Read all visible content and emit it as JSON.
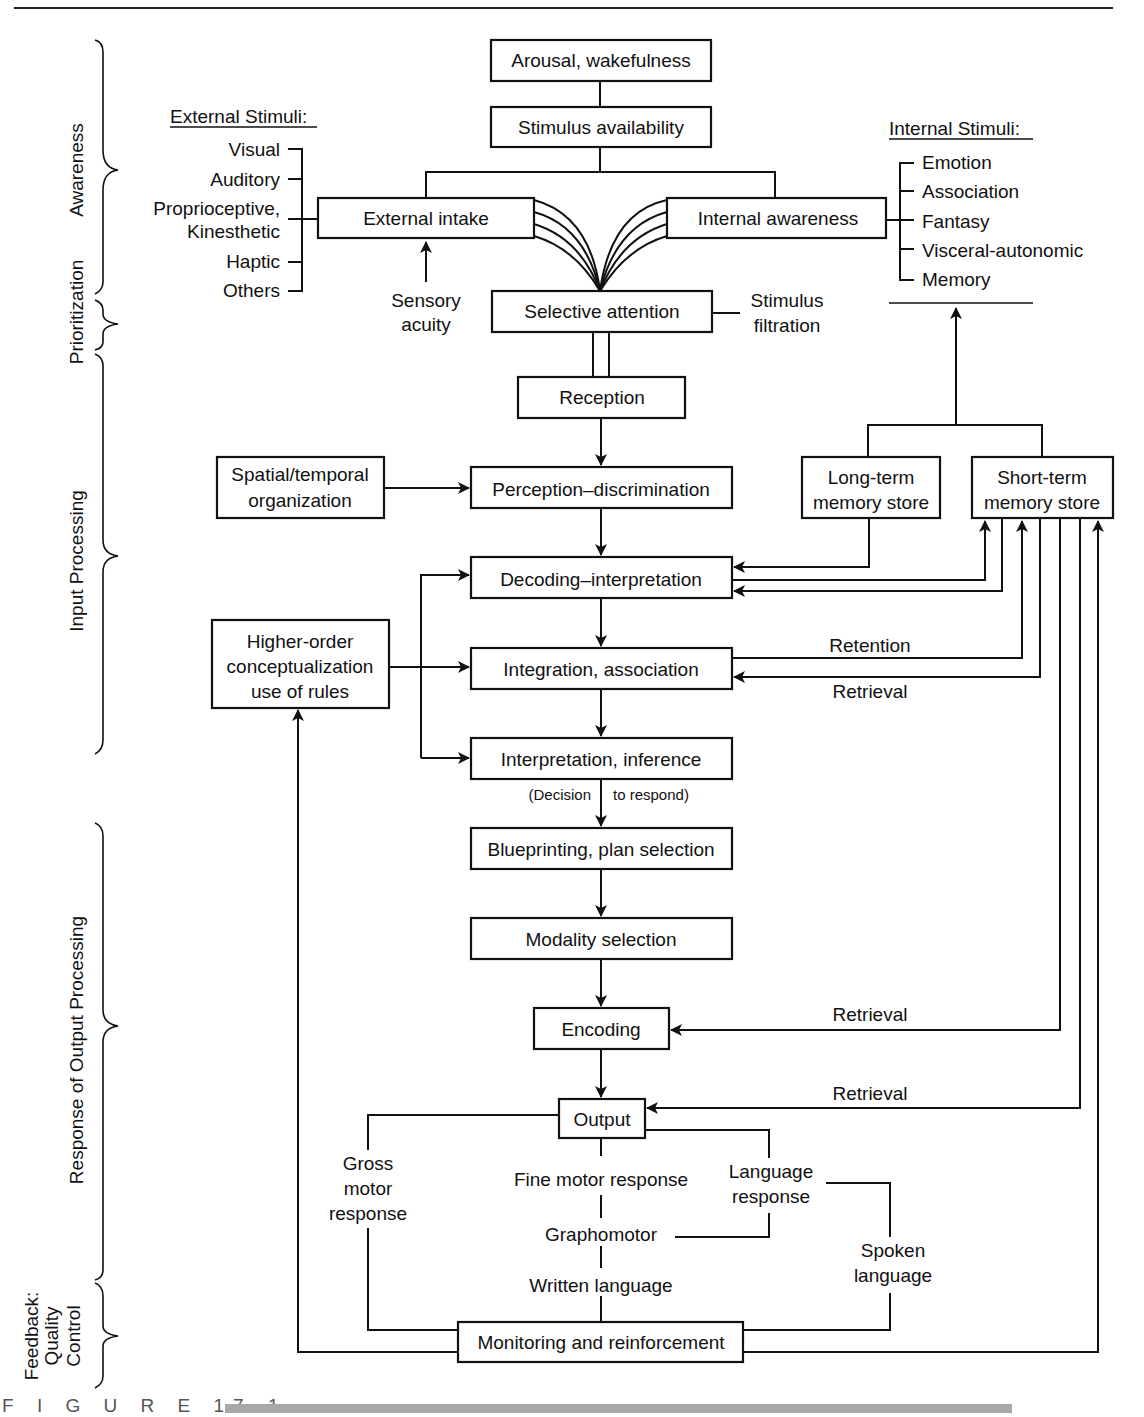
{
  "figure": {
    "caption": "F I G U R E 17-1",
    "caption_bar_color": "#9a9a9a"
  },
  "stages": {
    "awareness": "Awareness",
    "prioritization": "Prioritization",
    "input_processing": "Input Processing",
    "output_processing": "Response of Output Processing",
    "feedback": [
      "Feedback:",
      "Quality",
      "Control"
    ]
  },
  "external_stimuli": {
    "title": "External Stimuli:",
    "items": [
      "Visual",
      "Auditory",
      "Proprioceptive,",
      "Kinesthetic",
      "Haptic",
      "Others"
    ]
  },
  "internal_stimuli": {
    "title": "Internal Stimuli:",
    "items": [
      "Emotion",
      "Association",
      "Fantasy",
      "Visceral-autonomic",
      "Memory"
    ]
  },
  "boxes": {
    "arousal": "Arousal, wakefulness",
    "stimulus_availability": "Stimulus availability",
    "external_intake": "External intake",
    "internal_awareness": "Internal awareness",
    "selective_attention": "Selective attention",
    "reception": "Reception",
    "spatial_temporal": [
      "Spatial/temporal",
      "organization"
    ],
    "perception": "Perception–discrimination",
    "long_term_memory": [
      "Long-term",
      "memory store"
    ],
    "short_term_memory": [
      "Short-term",
      "memory store"
    ],
    "decoding": "Decoding–interpretation",
    "higher_order": [
      "Higher-order",
      "conceptualization",
      "use of rules"
    ],
    "integration": "Integration, association",
    "interpretation": "Interpretation, inference",
    "blueprinting": "Blueprinting, plan selection",
    "modality": "Modality selection",
    "encoding": "Encoding",
    "output": "Output",
    "monitoring": "Monitoring and reinforcement"
  },
  "labels": {
    "sensory_acuity": [
      "Sensory",
      "acuity"
    ],
    "stimulus_filtration": [
      "Stimulus",
      "filtration"
    ],
    "retention": "Retention",
    "retrieval_integration": "Retrieval",
    "retrieval_encoding": "Retrieval",
    "retrieval_output": "Retrieval",
    "decision_left": "(Decision",
    "decision_right": "to respond)",
    "gross_motor": [
      "Gross",
      "motor",
      "response"
    ],
    "fine_motor": "Fine motor response",
    "graphomotor": "Graphomotor",
    "written_language": "Written language",
    "language_response": [
      "Language",
      "response"
    ],
    "spoken_language": [
      "Spoken",
      "language"
    ]
  }
}
